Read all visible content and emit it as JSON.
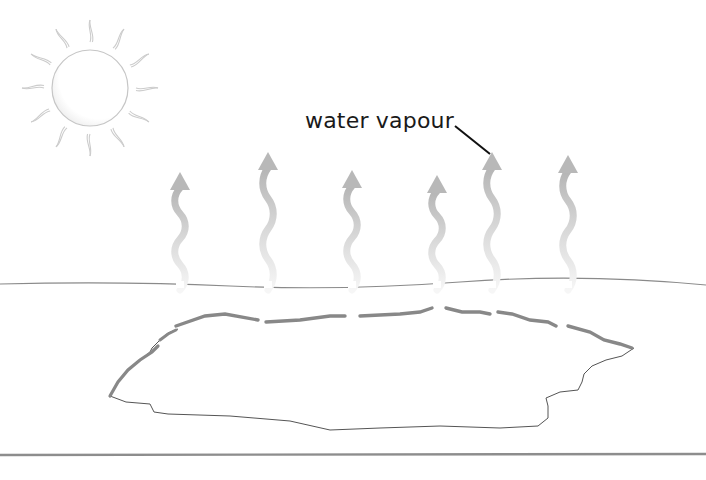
{
  "diagram": {
    "label": {
      "text": "water vapour",
      "x": 305,
      "y": 112,
      "leader": {
        "x1": 455,
        "y1": 126,
        "x2": 490,
        "y2": 154
      }
    },
    "sun": {
      "cx": 90,
      "cy": 88,
      "r": 38,
      "ray_count": 12,
      "stroke": "#c8c8c8"
    },
    "vapour_arrows": [
      {
        "x": 180,
        "top": 172,
        "bottom": 290
      },
      {
        "x": 268,
        "top": 152,
        "bottom": 290
      },
      {
        "x": 352,
        "top": 170,
        "bottom": 290
      },
      {
        "x": 437,
        "top": 175,
        "bottom": 290
      },
      {
        "x": 492,
        "top": 152,
        "bottom": 290
      },
      {
        "x": 568,
        "top": 155,
        "bottom": 290
      }
    ],
    "colors": {
      "arrow_top": "#b9b9b9",
      "arrow_bottom": "#f4f4f4",
      "ground_line": "#7a7a7a",
      "puddle_edge": "#8a8a8a",
      "puddle_outline": "#555555",
      "label_text": "#1a1a1a",
      "leader": "#111111"
    },
    "ground_line_y": 284,
    "baseline_y": 455
  }
}
